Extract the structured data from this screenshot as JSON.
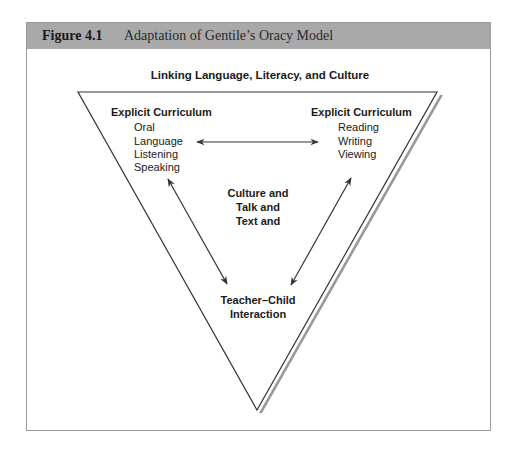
{
  "header": {
    "figure_number": "Figure 4.1",
    "figure_title": "Adaptation of Gentile’s Oracy Model"
  },
  "diagram": {
    "title": "Linking Language, Literacy, and Culture",
    "left": {
      "heading": "Explicit Curriculum",
      "items": [
        "Oral",
        "Language",
        "Listening",
        "Speaking"
      ]
    },
    "right": {
      "heading": "Explicit Curriculum",
      "items": [
        "Reading",
        "Writing",
        "Viewing"
      ]
    },
    "center": {
      "lines": [
        "Culture and",
        "Talk and",
        "Text and"
      ]
    },
    "bottom": {
      "lines": [
        "Teacher–Child",
        "Interaction"
      ]
    },
    "colors": {
      "header_bg": "#a9a9a9",
      "frame_border": "#9a9a9a",
      "line": "#333333",
      "shadow": "#999999"
    }
  }
}
